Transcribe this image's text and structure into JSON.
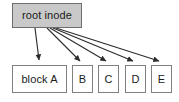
{
  "diagram": {
    "type": "node-link-diagram",
    "colors": {
      "background": "#ffffff",
      "root_fill": "#c9c9c9",
      "box_fill": "#ffffff",
      "box_stroke": "#808080",
      "arrow_stroke": "#2b2b2b",
      "text": "#1a1a1a"
    },
    "nodes": [
      {
        "id": "root-inode",
        "label": "root inode",
        "filled": true,
        "x": 12,
        "y": 3,
        "w": 70,
        "h": 25
      },
      {
        "id": "block-a",
        "label": "block A",
        "filled": false,
        "x": 12,
        "y": 65,
        "w": 55,
        "h": 28
      },
      {
        "id": "block-b",
        "label": "B",
        "filled": false,
        "x": 72,
        "y": 65,
        "w": 21,
        "h": 28
      },
      {
        "id": "block-c",
        "label": "C",
        "filled": false,
        "x": 98,
        "y": 65,
        "w": 21,
        "h": 28
      },
      {
        "id": "block-d",
        "label": "D",
        "filled": false,
        "x": 125,
        "y": 65,
        "w": 21,
        "h": 28
      },
      {
        "id": "block-e",
        "label": "E",
        "filled": false,
        "x": 151,
        "y": 65,
        "w": 21,
        "h": 28
      }
    ],
    "edges": [
      {
        "id": "edge-root-to-block-a",
        "from": "root-inode",
        "to": "block-a",
        "x1": 35,
        "y1": 28,
        "x2": 39,
        "y2": 61
      },
      {
        "id": "edge-root-to-block-b",
        "from": "root-inode",
        "to": "block-b",
        "x1": 47,
        "y1": 28,
        "x2": 81,
        "y2": 62
      },
      {
        "id": "edge-root-to-block-c",
        "from": "root-inode",
        "to": "block-c",
        "x1": 50,
        "y1": 28,
        "x2": 107,
        "y2": 62
      },
      {
        "id": "edge-root-to-block-d",
        "from": "root-inode",
        "to": "block-d",
        "x1": 53,
        "y1": 28,
        "x2": 134,
        "y2": 62
      },
      {
        "id": "edge-root-to-block-e",
        "from": "root-inode",
        "to": "block-e",
        "x1": 56,
        "y1": 28,
        "x2": 160,
        "y2": 62
      }
    ]
  }
}
